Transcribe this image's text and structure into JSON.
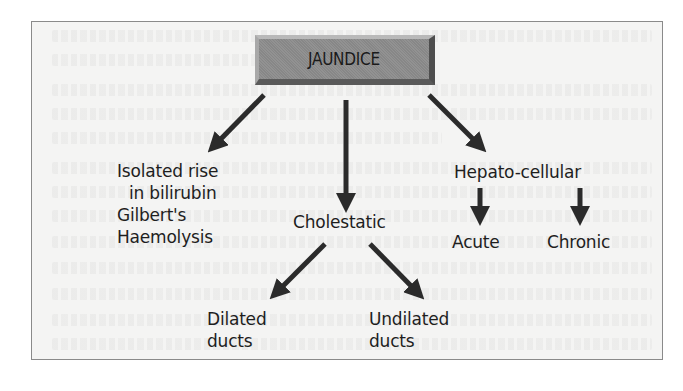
{
  "diagram": {
    "title": "JAUNDICE",
    "colors": {
      "root_box": "#8c8c8c",
      "arrow": "#2b2b2b",
      "text": "#1e1e1e",
      "frame_border": "#8a8a8a",
      "frame_background": "#f4f4f3"
    },
    "branches": {
      "isolated": {
        "lines": [
          "Isolated rise",
          "in bilirubin",
          "Gilbert's",
          "Haemolysis"
        ]
      },
      "cholestatic": {
        "label": "Cholestatic",
        "children": {
          "dilated": {
            "lines": [
              "Dilated",
              "ducts"
            ]
          },
          "undilated": {
            "lines": [
              "Undilated",
              "ducts"
            ]
          }
        }
      },
      "hepatocellular": {
        "label": "Hepato-cellular",
        "children": {
          "acute": {
            "label": "Acute"
          },
          "chronic": {
            "label": "Chronic"
          }
        }
      }
    },
    "edges": [
      {
        "from": "JAUNDICE",
        "to": "Isolated rise in bilirubin"
      },
      {
        "from": "JAUNDICE",
        "to": "Cholestatic"
      },
      {
        "from": "JAUNDICE",
        "to": "Hepato-cellular"
      },
      {
        "from": "Cholestatic",
        "to": "Dilated ducts"
      },
      {
        "from": "Cholestatic",
        "to": "Undilated ducts"
      },
      {
        "from": "Hepato-cellular",
        "to": "Acute"
      },
      {
        "from": "Hepato-cellular",
        "to": "Chronic"
      }
    ]
  }
}
